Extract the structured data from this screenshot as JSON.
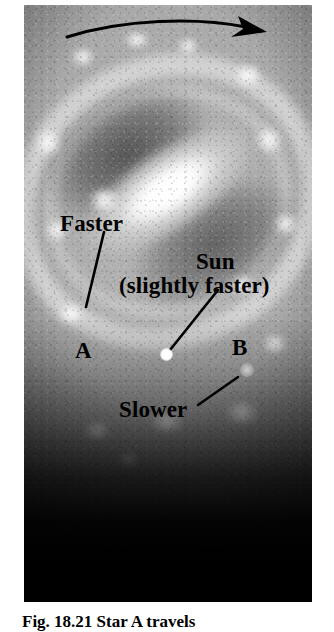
{
  "figure": {
    "kind": "astronomy-textbook-photo-figure",
    "caption": "Fig. 18.21 Star A travels",
    "photo": {
      "alt": "grayscale photograph of a barred spiral galaxy seen face-on, fading to black at the bottom",
      "base_color": "#8e8e8e",
      "bar_color": "#ffffff",
      "dust_lane_color": "#3a3a3a",
      "background_color": "#ffffff"
    }
  },
  "annotations": {
    "rotation_arrow": {
      "name": "rotation-direction-arrow",
      "description": "curved arrow across the top of the galaxy pointing to the right",
      "direction": "clockwise-to-the-right",
      "color": "#000000"
    },
    "labels": [
      {
        "id": "faster",
        "text": "Faster",
        "has_leader_line": true,
        "leader_from": [
          80,
          227
        ],
        "leader_to": [
          62,
          302
        ]
      },
      {
        "id": "sun",
        "line1": "Sun",
        "line2": "(slightly faster)",
        "has_leader_line": true,
        "leader_from": [
          194,
          285
        ],
        "leader_to": [
          146,
          345
        ]
      },
      {
        "id": "star-a",
        "text": "A",
        "has_leader_line": false
      },
      {
        "id": "star-b",
        "text": "B",
        "has_leader_line": false
      },
      {
        "id": "slower",
        "text": "Slower",
        "has_leader_line": true,
        "leader_from": [
          174,
          400
        ],
        "leader_to": [
          214,
          372
        ]
      }
    ],
    "markers": [
      {
        "id": "sun-marker",
        "label": "Sun",
        "brightness": "bright-white"
      },
      {
        "id": "star-b-marker",
        "label": "B",
        "brightness": "faint-grey"
      }
    ]
  }
}
